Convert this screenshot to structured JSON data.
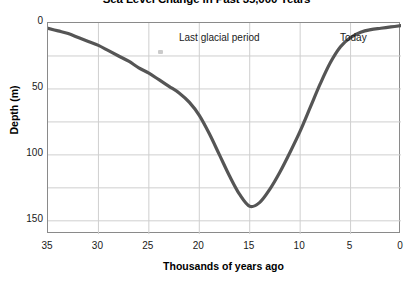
{
  "chart_data": {
    "type": "line",
    "title": "Sea Level Change in Past 35,000 Years",
    "xlabel": "Thousands of years ago",
    "ylabel": "Depth (m)",
    "xlim": [
      35,
      0
    ],
    "ylim": [
      0,
      160
    ],
    "y_inverted": true,
    "grid": true,
    "legend": "none",
    "xticks": [
      "35",
      "30",
      "25",
      "20",
      "15",
      "10",
      "5",
      "0"
    ],
    "xtick_values": [
      35,
      30,
      25,
      20,
      15,
      10,
      5,
      0
    ],
    "yticks": [
      "0",
      "50",
      "100",
      "150"
    ],
    "ytick_values": [
      0,
      50,
      100,
      150
    ],
    "gridline_y_values": [
      0,
      25,
      50,
      75,
      100,
      125,
      150
    ],
    "gridline_x_values": [
      30,
      25,
      20,
      15,
      10,
      5
    ],
    "series": [
      {
        "name": "Sea level depth below present",
        "color": "#555555",
        "x": [
          35,
          34,
          33,
          32,
          31,
          30,
          29,
          28,
          27,
          26,
          25,
          24,
          23,
          22,
          21,
          20,
          19,
          18,
          17,
          16,
          15,
          14,
          13,
          12,
          11,
          10,
          9,
          8,
          7,
          6,
          5,
          4,
          3,
          2,
          1,
          0
        ],
        "y": [
          4,
          6,
          8,
          11,
          14,
          17,
          21,
          25,
          29,
          34,
          38,
          43,
          48,
          53,
          60,
          70,
          84,
          100,
          116,
          130,
          139,
          136,
          126,
          113,
          98,
          82,
          64,
          46,
          30,
          18,
          11,
          7,
          5,
          4,
          3,
          2
        ]
      }
    ],
    "annotations": [
      {
        "text": "Last glacial period",
        "x": 22.3,
        "y_position": "top"
      },
      {
        "text": "Today",
        "x": 2.5,
        "y_position": "top"
      }
    ],
    "colors": {
      "line": "#555555",
      "grid": "#cfcfcf",
      "frame": "#8a8a8a",
      "background": "#ffffff",
      "text": "#1a1a1a"
    }
  }
}
